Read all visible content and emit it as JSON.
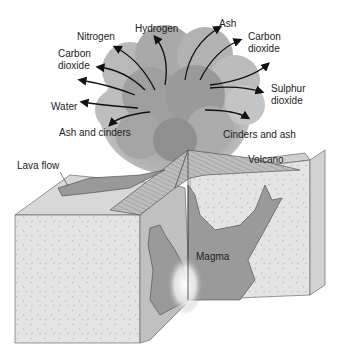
{
  "diagram": {
    "gas_labels": {
      "nitrogen": "Nitrogen",
      "hydrogen": "Hydrogen",
      "ash": "Ash",
      "carbon_dioxide_left_1": "Carbon",
      "carbon_dioxide_left_2": "dioxide",
      "carbon_dioxide_right_1": "Carbon",
      "carbon_dioxide_right_2": "dioxide",
      "sulphur_dioxide_1": "Sulphur",
      "sulphur_dioxide_2": "dioxide",
      "water": "Water",
      "ash_and_cinders": "Ash and cinders",
      "cinders_and_ash": "Cinders and ash"
    },
    "structure_labels": {
      "lava_flow": "Lava flow",
      "volcano": "Volcano",
      "magma": "Magma"
    },
    "colors": {
      "rock": "#e6e6e6",
      "rock_dark": "#c9c9c9",
      "magma": "#9a9a9a",
      "cloud": "#8d8d8d",
      "arrow": "#111111"
    }
  }
}
